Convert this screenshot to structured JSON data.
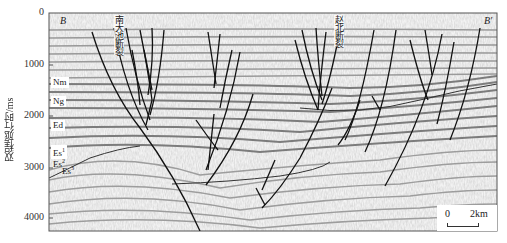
{
  "figure": {
    "y_axis": {
      "label": "双程旅行时/ms",
      "ticks": [
        {
          "value": "0",
          "y": 13
        },
        {
          "value": "1000",
          "y": 65
        },
        {
          "value": "2000",
          "y": 116
        },
        {
          "value": "3000",
          "y": 168
        },
        {
          "value": "4000",
          "y": 218
        }
      ]
    },
    "corners": {
      "left": "B",
      "right": "B′"
    },
    "faults": [
      {
        "name": "南大池断裂"
      },
      {
        "name": "赵北断裂"
      }
    ],
    "strata": [
      {
        "base": "Nm",
        "sup": ""
      },
      {
        "base": "Ng",
        "sup": ""
      },
      {
        "base": "Ed",
        "sup": ""
      },
      {
        "base": "Es",
        "sup": "1"
      },
      {
        "base": "Es",
        "sup": "2"
      },
      {
        "base": "Es",
        "sup": "3"
      }
    ],
    "scale": {
      "start": "0",
      "end": "2km"
    },
    "colors": {
      "fault_line": "#111111",
      "reflector": "#8a8a8a",
      "background": "#f2f2f2",
      "frame": "#555555"
    }
  }
}
